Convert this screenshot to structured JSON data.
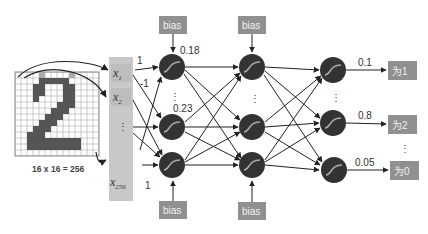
{
  "diagram": {
    "caption": "16 x 16 = 256",
    "inputs": [
      {
        "label": "x",
        "sub": "1"
      },
      {
        "label": "x",
        "sub": "2"
      },
      {
        "label": "⋮",
        "sub": ""
      },
      {
        "label": "x",
        "sub": "256"
      }
    ],
    "bias_label": "bias",
    "input_weights": {
      "w1": "1",
      "w2": "-1",
      "w3": "1"
    },
    "hidden1_values": {
      "top": "0.18",
      "mid": "0.23"
    },
    "outputs": [
      {
        "value": "0.1",
        "label": "为1"
      },
      {
        "value": "0.8",
        "label": "为2"
      },
      {
        "value": "0.05",
        "label": "为0"
      }
    ],
    "ellipsis": "⋮",
    "colors": {
      "node": "#333333",
      "box": "#909090",
      "input_col": "#c8c8c8",
      "pixel_dark": "#555555",
      "grid": "#b0b0b0"
    }
  }
}
